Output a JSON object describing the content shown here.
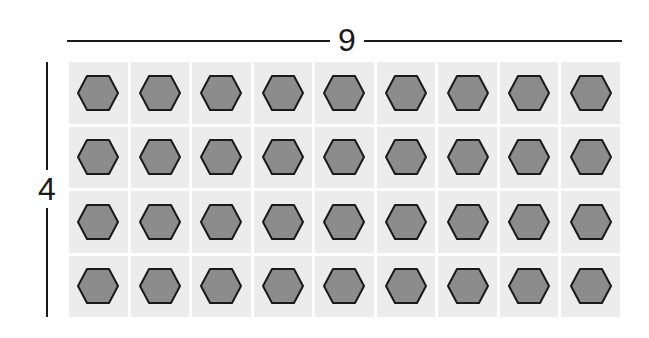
{
  "diagram": {
    "columns_label": "9",
    "rows_label": "4",
    "columns": 9,
    "rows": 4,
    "item_shape": "hexagon",
    "colors": {
      "cell_background": "#ececec",
      "hexagon_fill": "#8c8c8c",
      "hexagon_stroke": "#1a1a1a",
      "line": "#1a1a1a"
    }
  }
}
